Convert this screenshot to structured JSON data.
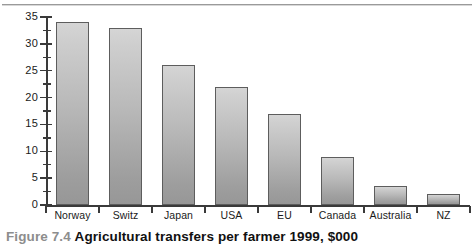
{
  "figure": {
    "number_label": "Figure 7.4",
    "title": "Agricultural transfers per farmer 1999, $000"
  },
  "chart_data": {
    "type": "bar",
    "title": "Agricultural transfers per farmer 1999, $000",
    "xlabel": "",
    "ylabel": "",
    "ylim": [
      0,
      35
    ],
    "ytick_values": [
      0,
      5,
      10,
      15,
      20,
      25,
      30,
      35
    ],
    "ytick_labels": [
      "0",
      "5",
      "10",
      "15",
      "20",
      "25",
      "30",
      "35"
    ],
    "minor_tick_step": 2.5,
    "grid": false,
    "legend": "none",
    "units": "$000 per farmer",
    "categories": [
      "Norway",
      "Switz",
      "Japan",
      "USA",
      "EU",
      "Canada",
      "Australia",
      "NZ"
    ],
    "values": [
      34,
      33,
      26,
      22,
      17,
      9,
      3.5,
      2
    ],
    "bar_color_top": "#d5d5d5",
    "bar_color_bottom": "#979797",
    "bar_edge_color": "#5d5d5d",
    "axis_color": "#3a3a3a",
    "background_color": "#ffffff"
  }
}
